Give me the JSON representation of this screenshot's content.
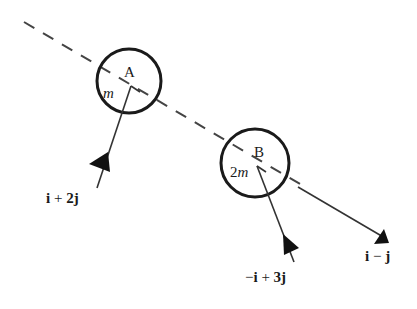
{
  "diagram": {
    "type": "collision-of-particles",
    "line_of_centres": "dashed",
    "colors": {
      "stroke": "#1a1a1a",
      "dashed_line": "#444444",
      "background": "#ffffff"
    },
    "particles": [
      {
        "name": "A",
        "label": "A",
        "mass_label": "m",
        "velocity_label": {
          "i": "i",
          "op": "+",
          "j": "2j",
          "full": "i + 2j"
        }
      },
      {
        "name": "B",
        "label": "B",
        "mass_coefficient": "2",
        "mass_symbol": "m",
        "mass_label": "2m",
        "velocity_label": {
          "neg": "−",
          "i": "i",
          "op": "+",
          "j": "3j",
          "full": "−i + 3j"
        }
      }
    ],
    "result_vector": {
      "i": "i",
      "op": "−",
      "j": "j",
      "full": "i − j"
    }
  }
}
